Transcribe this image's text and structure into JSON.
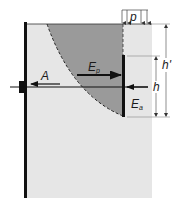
{
  "diagram": {
    "type": "anchored sheet pile with anchor plate earth pressure diagram",
    "colors": {
      "soil": "#e6e6e6",
      "passive_wedge": "#9a9a9a",
      "lines": "#111111",
      "background": "#ffffff"
    },
    "labels": {
      "surcharge": "p",
      "anchor_force": "A",
      "passive_pressure": "E",
      "passive_sub": "p",
      "active_pressure": "E",
      "active_sub": "a",
      "anchor_height": "h",
      "total_height": "h'"
    },
    "elements": [
      {
        "name": "sheet-pile-wall",
        "description": "vertical wall on the left"
      },
      {
        "name": "anchor-head",
        "description": "block on wall at tie rod level"
      },
      {
        "name": "tie-rod",
        "description": "horizontal rod from wall to anchor plate"
      },
      {
        "name": "anchor-plate",
        "description": "vertical plate at end of tie rod"
      },
      {
        "name": "passive-wedge",
        "description": "shaded soil zone bounded by a dashed curve"
      },
      {
        "name": "surcharge-load",
        "description": "uniform load p at surface"
      }
    ]
  }
}
